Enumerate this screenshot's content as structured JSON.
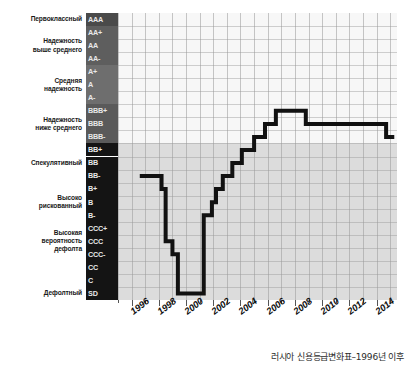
{
  "caption": "러시아 신용등급변화표–1996년 이후",
  "category_labels": [
    {
      "text": "Первоклассный",
      "rating_index": 0
    },
    {
      "text": "Надежность\nвыше среднего",
      "rating_index": 2
    },
    {
      "text": "Средняя\nнадежность",
      "rating_index": 5
    },
    {
      "text": "Надежность\nниже среднего",
      "rating_index": 8
    },
    {
      "text": "Спекулятивный",
      "rating_index": 11
    },
    {
      "text": "Высоко\nрискованный",
      "rating_index": 14
    },
    {
      "text": "Высокая\nвероятность\nдефолта",
      "rating_index": 17
    },
    {
      "text": "Дефолтный",
      "rating_index": 21
    }
  ],
  "ratings": [
    {
      "label": "AAA",
      "band": "prime",
      "bg": "#4a4a4a"
    },
    {
      "label": "AA+",
      "band": "high",
      "bg": "#5e5e5e"
    },
    {
      "label": "AA",
      "band": "high",
      "bg": "#5e5e5e"
    },
    {
      "label": "AA-",
      "band": "high",
      "bg": "#5e5e5e"
    },
    {
      "label": "A+",
      "band": "upper-medium",
      "bg": "#6e6e6e"
    },
    {
      "label": "A",
      "band": "upper-medium",
      "bg": "#6e6e6e"
    },
    {
      "label": "A-",
      "band": "upper-medium",
      "bg": "#6e6e6e"
    },
    {
      "label": "BBB+",
      "band": "lower-medium",
      "bg": "#5a5a5a"
    },
    {
      "label": "BBB",
      "band": "lower-medium",
      "bg": "#5a5a5a"
    },
    {
      "label": "BBB-",
      "band": "lower-medium",
      "bg": "#5a5a5a"
    },
    {
      "label": "BB+",
      "band": "speculative",
      "bg": "#141414"
    },
    {
      "label": "BB",
      "band": "speculative",
      "bg": "#141414"
    },
    {
      "label": "BB-",
      "band": "speculative",
      "bg": "#141414"
    },
    {
      "label": "B+",
      "band": "highly-spec",
      "bg": "#141414"
    },
    {
      "label": "B",
      "band": "highly-spec",
      "bg": "#141414"
    },
    {
      "label": "B-",
      "band": "highly-spec",
      "bg": "#141414"
    },
    {
      "label": "CCC+",
      "band": "default-risk",
      "bg": "#141414"
    },
    {
      "label": "CCC",
      "band": "default-risk",
      "bg": "#141414"
    },
    {
      "label": "CCC-",
      "band": "default-risk",
      "bg": "#141414"
    },
    {
      "label": "CC",
      "band": "default-risk",
      "bg": "#141414"
    },
    {
      "label": "C",
      "band": "default-risk",
      "bg": "#141414"
    },
    {
      "label": "SD",
      "band": "default",
      "bg": "#141414"
    }
  ],
  "chart_data": {
    "type": "line",
    "title": "",
    "xlabel": "",
    "ylabel": "",
    "step": "post",
    "grid": true,
    "legend": null,
    "xlim": [
      1995,
      2015.5
    ],
    "xtick_labels": [
      "1996",
      "1998",
      "2000",
      "2002",
      "2004",
      "2006",
      "2008",
      "2010",
      "2012",
      "2014"
    ],
    "xticks": [
      1996,
      1998,
      2000,
      2002,
      2004,
      2006,
      2008,
      2010,
      2012,
      2014
    ],
    "ylim_categories": [
      "AAA",
      "AA+",
      "AA",
      "AA-",
      "A+",
      "A",
      "A-",
      "BBB+",
      "BBB",
      "BBB-",
      "BB+",
      "BB",
      "BB-",
      "B+",
      "B",
      "B-",
      "CCC+",
      "CCC",
      "CCC-",
      "CC",
      "C",
      "SD"
    ],
    "line_color": "#111111",
    "line_width_px": 4,
    "series": [
      {
        "name": "Russia sovereign credit rating",
        "points": [
          {
            "year": 1996.6,
            "rating": "BB-"
          },
          {
            "year": 1998.2,
            "rating": "BB-"
          },
          {
            "year": 1998.2,
            "rating": "B+"
          },
          {
            "year": 1998.5,
            "rating": "B+"
          },
          {
            "year": 1998.5,
            "rating": "CCC"
          },
          {
            "year": 1999.0,
            "rating": "CCC"
          },
          {
            "year": 1999.0,
            "rating": "CCC-"
          },
          {
            "year": 1999.4,
            "rating": "CCC-"
          },
          {
            "year": 1999.4,
            "rating": "SD"
          },
          {
            "year": 2001.3,
            "rating": "SD"
          },
          {
            "year": 2001.3,
            "rating": "B-"
          },
          {
            "year": 2001.9,
            "rating": "B-"
          },
          {
            "year": 2001.9,
            "rating": "B"
          },
          {
            "year": 2002.2,
            "rating": "B"
          },
          {
            "year": 2002.2,
            "rating": "B+"
          },
          {
            "year": 2002.7,
            "rating": "B+"
          },
          {
            "year": 2002.7,
            "rating": "BB-"
          },
          {
            "year": 2003.4,
            "rating": "BB-"
          },
          {
            "year": 2003.4,
            "rating": "BB"
          },
          {
            "year": 2004.1,
            "rating": "BB"
          },
          {
            "year": 2004.1,
            "rating": "BB+"
          },
          {
            "year": 2005.0,
            "rating": "BB+"
          },
          {
            "year": 2005.0,
            "rating": "BBB-"
          },
          {
            "year": 2005.8,
            "rating": "BBB-"
          },
          {
            "year": 2005.8,
            "rating": "BBB"
          },
          {
            "year": 2006.6,
            "rating": "BBB"
          },
          {
            "year": 2006.6,
            "rating": "BBB+"
          },
          {
            "year": 2008.8,
            "rating": "BBB+"
          },
          {
            "year": 2008.8,
            "rating": "BBB"
          },
          {
            "year": 2014.7,
            "rating": "BBB"
          },
          {
            "year": 2014.7,
            "rating": "BBB-"
          },
          {
            "year": 2015.3,
            "rating": "BBB-"
          }
        ]
      }
    ]
  }
}
